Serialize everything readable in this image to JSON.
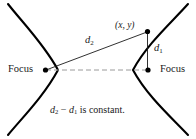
{
  "figure": {
    "colors": {
      "curve": "#000000",
      "segment": "#1a1a1a",
      "axis_dashed": "#9a9a9a",
      "text": "#1a1a1a",
      "background": "#ffffff"
    },
    "labels": {
      "focus_left": "Focus",
      "focus_right": "Focus",
      "point": "(x,  y)",
      "d2": "d",
      "d2_sub": "2",
      "d1": "d",
      "d1_sub": "1"
    },
    "caption": {
      "d2": "d",
      "d2_sub": "2",
      "minus": " − ",
      "d1": "d",
      "d1_sub": "1",
      "text": " is constant."
    },
    "geometry": {
      "left_focus": {
        "x": 45,
        "y": 70
      },
      "right_focus": {
        "x": 148,
        "y": 70
      },
      "point": {
        "x": 148,
        "y": 32
      },
      "left_vertex": {
        "x": 58,
        "y": 70
      },
      "right_vertex": {
        "x": 133,
        "y": 70
      }
    }
  }
}
